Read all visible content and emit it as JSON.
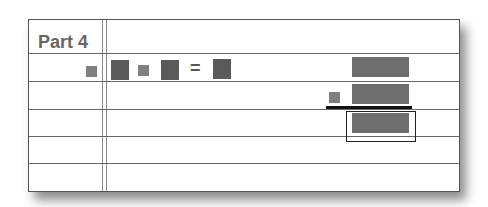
{
  "worksheet": {
    "title": "Part 4",
    "rows": 6,
    "equation": {
      "symbols": [
        "small-square",
        "large-square",
        "small-square",
        "large-square",
        "=",
        "large-square"
      ],
      "equals_sign": "="
    },
    "vertical_work": {
      "addend_top": "large-rectangle",
      "addend_bottom": [
        "small-square",
        "large-rectangle"
      ],
      "answer": "large-rectangle"
    },
    "colors": {
      "small_square": "#808080",
      "large_square": "#5a5a5a",
      "rectangle": "#6e6e6e",
      "line": "#111111"
    }
  }
}
